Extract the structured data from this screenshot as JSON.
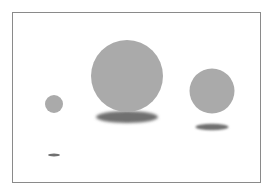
{
  "diagram": {
    "colors": {
      "background": "#ffffff",
      "frame_border": "#8a8a8a",
      "sphere_fill": "#aaaaaa",
      "shadow_fill": "#6f6f6f"
    },
    "objects": [
      {
        "id": "sphere-small",
        "kind": "sphere",
        "size": "small"
      },
      {
        "id": "sphere-large",
        "kind": "sphere",
        "size": "large"
      },
      {
        "id": "sphere-medium",
        "kind": "sphere",
        "size": "medium"
      }
    ],
    "shadows": [
      {
        "id": "shadow-small",
        "casts_for": "sphere-small"
      },
      {
        "id": "shadow-large",
        "casts_for": "sphere-large"
      },
      {
        "id": "shadow-medium",
        "casts_for": "sphere-medium"
      }
    ]
  }
}
